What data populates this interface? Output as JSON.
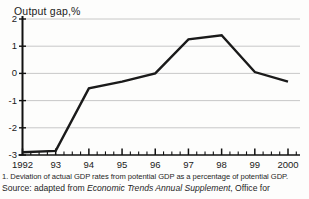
{
  "top_clipped_artifact": "· · · ·",
  "chart_data": {
    "type": "line",
    "title": "Output gap,%",
    "xlabel": "",
    "ylabel": "Output gap,%",
    "x": [
      "1992",
      "93",
      "94",
      "95",
      "96",
      "97",
      "98",
      "99",
      "2000"
    ],
    "tick_labels": [
      "1992",
      "93",
      "94",
      "95",
      "96",
      "97",
      "98",
      "99",
      "2000"
    ],
    "values": [
      -2.9,
      -2.85,
      -0.55,
      -0.3,
      0.0,
      1.25,
      1.4,
      0.05,
      -0.3
    ],
    "y_ticks": [
      "2",
      "1",
      "0",
      "-1",
      "-2",
      "-3"
    ],
    "y_tick_values": [
      2,
      1,
      0,
      -1,
      -2,
      -3
    ],
    "ylim": [
      -3,
      2
    ],
    "grid": "horizontal",
    "legend": "none",
    "minor_ticks_per_interval": 4,
    "line_color": "#1a1a1a",
    "grid_color": "#c2c2c2",
    "axis_color": "#111111"
  },
  "notes": {
    "footnote_1": "1. Deviation of actual GDP rates from potential GDP as a percentage of potential GDP.",
    "source_prefix": "Source: adapted from ",
    "source_italic": "Economic Trends Annual Supplement",
    "source_suffix": ", Office for"
  }
}
